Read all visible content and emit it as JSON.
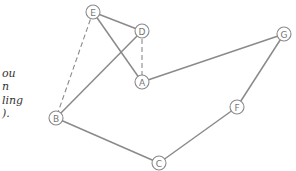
{
  "caption": {
    "lines": [
      "ou",
      "n",
      "ling",
      ")."
    ]
  },
  "graph": {
    "nodes": [
      {
        "id": "E",
        "label": "E",
        "x": 93,
        "y": 12
      },
      {
        "id": "D",
        "label": "D",
        "x": 142,
        "y": 31
      },
      {
        "id": "A",
        "label": "A",
        "x": 142,
        "y": 82
      },
      {
        "id": "B",
        "label": "B",
        "x": 56,
        "y": 118
      },
      {
        "id": "C",
        "label": "C",
        "x": 159,
        "y": 163
      },
      {
        "id": "F",
        "label": "F",
        "x": 237,
        "y": 107
      },
      {
        "id": "G",
        "label": "G",
        "x": 284,
        "y": 34
      }
    ],
    "edges": [
      {
        "from": "E",
        "to": "D",
        "style": "solid"
      },
      {
        "from": "E",
        "to": "A",
        "style": "solid"
      },
      {
        "from": "D",
        "to": "A",
        "style": "dashed"
      },
      {
        "from": "D",
        "to": "B",
        "style": "solid"
      },
      {
        "from": "E",
        "to": "B",
        "style": "dashed"
      },
      {
        "from": "A",
        "to": "G",
        "style": "solid"
      },
      {
        "from": "G",
        "to": "F",
        "style": "solid"
      },
      {
        "from": "F",
        "to": "C",
        "style": "solid"
      },
      {
        "from": "B",
        "to": "C",
        "style": "solid"
      }
    ],
    "colors": {
      "edge": "#8a8a8a",
      "node_stroke": "#8a8a8a",
      "label": "#777777"
    }
  }
}
